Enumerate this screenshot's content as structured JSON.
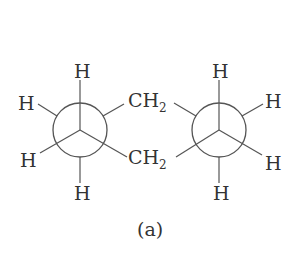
{
  "figure": {
    "caption": "(a)",
    "left_newman": {
      "front_substituents": [
        "H",
        "H",
        "H"
      ],
      "back_substituents": [
        "H",
        "H"
      ],
      "labels": {
        "top": "H",
        "upper_left": "H",
        "lower_left": "H",
        "bottom": "H"
      }
    },
    "bridge": {
      "upper": {
        "atom": "CH",
        "subscript": "2"
      },
      "lower": {
        "atom": "CH",
        "subscript": "2"
      }
    },
    "right_newman": {
      "labels": {
        "top": "H",
        "upper_right": "H",
        "lower_right": "H",
        "bottom": "H"
      }
    },
    "colors": {
      "ink": "#333333",
      "line": "#555555",
      "background": "#ffffff"
    }
  }
}
